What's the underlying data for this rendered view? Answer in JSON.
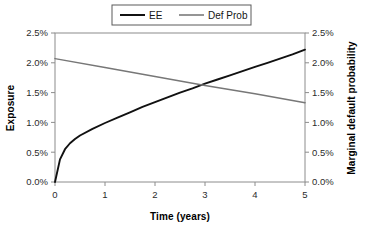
{
  "chart_data": {
    "type": "line",
    "title": "",
    "xlabel": "Time (years)",
    "ylabel": "Exposure",
    "y2label": "Marginal default probability",
    "xlim": [
      0,
      5
    ],
    "ylim": [
      0,
      0.025
    ],
    "y2lim": [
      0,
      0.025
    ],
    "grid": false,
    "legend_position": "top-center",
    "xticks": [
      0,
      1,
      2,
      3,
      4,
      5
    ],
    "xtick_labels": [
      "0",
      "1",
      "2",
      "3",
      "4",
      "5"
    ],
    "yticks": [
      0.0,
      0.005,
      0.01,
      0.015,
      0.02,
      0.025
    ],
    "ytick_labels": [
      "0.0%",
      "0.5%",
      "1.0%",
      "1.5%",
      "2.0%",
      "2.5%"
    ],
    "y2ticks": [
      0.0,
      0.005,
      0.01,
      0.015,
      0.02,
      0.025
    ],
    "y2tick_labels": [
      "0.0%",
      "0.5%",
      "1.0%",
      "1.5%",
      "2.0%",
      "2.5%"
    ],
    "series": [
      {
        "name": "EE",
        "axis": "left",
        "color": "#111111",
        "width": 1.9,
        "x": [
          0,
          0.1,
          0.2,
          0.3,
          0.4,
          0.5,
          0.75,
          1.0,
          1.25,
          1.5,
          1.75,
          2.0,
          2.25,
          2.5,
          2.75,
          3.0,
          3.25,
          3.5,
          3.75,
          4.0,
          4.25,
          4.5,
          4.75,
          5.0
        ],
        "values": [
          0.0,
          0.0038,
          0.0055,
          0.0065,
          0.0072,
          0.0078,
          0.0089,
          0.0099,
          0.0108,
          0.0117,
          0.0126,
          0.0134,
          0.0142,
          0.015,
          0.0157,
          0.0165,
          0.0172,
          0.0179,
          0.0186,
          0.0193,
          0.02,
          0.0207,
          0.0214,
          0.0222
        ]
      },
      {
        "name": "Def Prob",
        "axis": "right",
        "color": "#777777",
        "width": 1.5,
        "x": [
          0,
          1,
          2,
          3,
          4,
          5
        ],
        "values": [
          0.0207,
          0.0192,
          0.0177,
          0.0162,
          0.0148,
          0.0133
        ]
      }
    ],
    "annotations": []
  },
  "legend": {
    "items": [
      {
        "label": "EE",
        "color": "#111111"
      },
      {
        "label": "Def Prob",
        "color": "#8a8a8a"
      }
    ]
  },
  "axes": {
    "left_title": "Exposure",
    "right_title": "Marginal default probability",
    "bottom_title": "Time (years)"
  }
}
